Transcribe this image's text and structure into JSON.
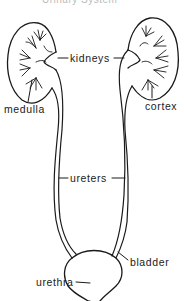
{
  "title": "Urinary System",
  "labels": {
    "kidneys": "kidneys",
    "medulla": "medulla",
    "cortex": "cortex",
    "ureters": "ureters",
    "bladder": "bladder",
    "urethra": "urethra"
  },
  "colors": {
    "stroke": "#1a1a1a",
    "background": "#ffffff"
  }
}
